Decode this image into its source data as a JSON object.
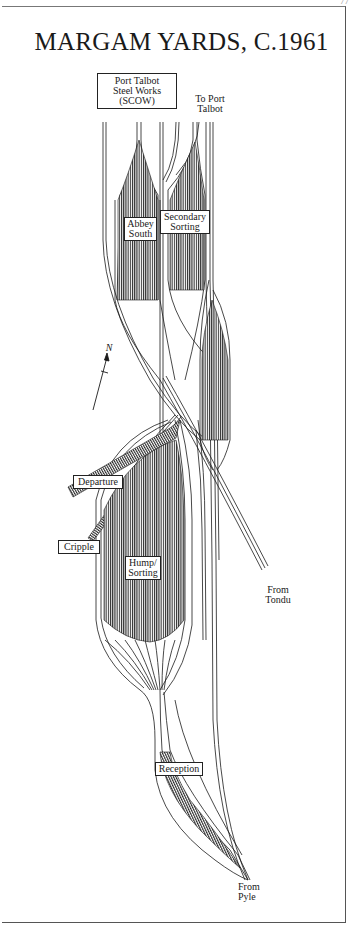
{
  "page": {
    "page_number": "77",
    "title": "MARGAM YARDS, C.1961"
  },
  "labels": {
    "steelworks": "Port Talbot Steel Works (SCOW)",
    "steelworks_l1": "Port Talbot",
    "steelworks_l2": "Steel Works",
    "steelworks_l3": "(SCOW)",
    "to_port_talbot_l1": "To Port",
    "to_port_talbot_l2": "Talbot",
    "abbey_south_l1": "Abbey",
    "abbey_south_l2": "South",
    "secondary_sorting_l1": "Secondary",
    "secondary_sorting_l2": "Sorting",
    "departure": "Departure",
    "cripple": "Cripple",
    "hump_sorting_l1": "Hump/",
    "hump_sorting_l2": "Sorting",
    "from_tondu_l1": "From",
    "from_tondu_l2": "Tondu",
    "reception": "Reception",
    "from_pyle_l1": "From",
    "from_pyle_l2": "Pyle",
    "north_arrow": "N"
  },
  "colors": {
    "line": "#1a1a1a",
    "yard_fill": "#3a3a3a",
    "frame": "#555555",
    "background": "#ffffff"
  }
}
